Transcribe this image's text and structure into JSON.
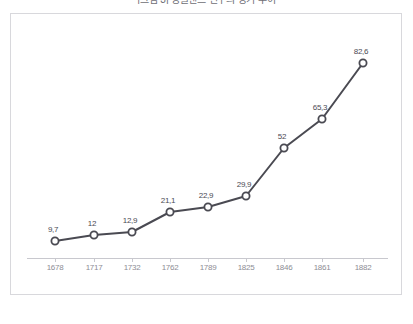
{
  "chart_data": {
    "type": "line",
    "title": "[그림 3] 잉글랜드 인구의 장기 추이",
    "subtitle": "",
    "xlabel": "",
    "ylabel": "",
    "categories": [
      "1678",
      "1717",
      "1732",
      "1762",
      "1789",
      "1825",
      "1846",
      "1861",
      "1882"
    ],
    "values": [
      9.7,
      12,
      12.9,
      21.1,
      22.9,
      29.9,
      52,
      65.3,
      82.6
    ],
    "point_labels": [
      "9,7",
      "12",
      "12,9",
      "21,1",
      "22,9",
      "29,9",
      "52",
      "65,3",
      "82,6"
    ],
    "ylim": [
      0,
      92
    ],
    "xlim_labels": [
      "1678",
      "1882"
    ],
    "grid": false,
    "legend": false,
    "marker": "open-circle",
    "series": [
      {
        "name": "series-1",
        "values": [
          9.7,
          12,
          12.9,
          21.1,
          22.9,
          29.9,
          52,
          65.3,
          82.6
        ]
      }
    ],
    "colors": {
      "line": "#4a4a52",
      "marker_fill": "#ffffff",
      "marker_stroke": "#4a4a52",
      "axis": "#c8c8ce",
      "frame": "#d8d8dc",
      "tick_label": "#8d8d95",
      "point_label": "#4b4b53",
      "background": "#ffffff"
    }
  },
  "layout": {
    "frame": {
      "left": 10,
      "top": 13,
      "width": 392,
      "height": 282
    },
    "axis_y": 258,
    "axis_x_start": 27,
    "axis_x_end": 388,
    "point_x": [
      55,
      94,
      132,
      170,
      208,
      246,
      284,
      322,
      363
    ],
    "point_y": [
      241,
      235,
      232,
      212,
      207,
      196,
      148,
      119,
      63
    ],
    "tick_x": [
      55,
      94,
      132,
      170,
      208,
      246,
      284,
      322,
      363
    ],
    "tick_label_y": 263
  }
}
